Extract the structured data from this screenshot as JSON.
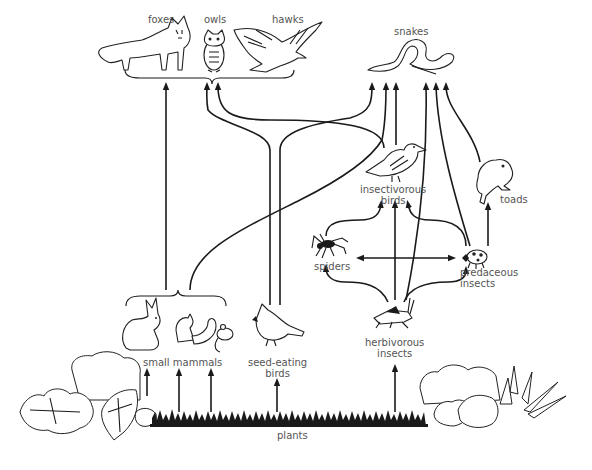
{
  "diagram": {
    "type": "food-web",
    "nodes": {
      "foxes": {
        "label": "foxes",
        "icon": "fox-icon"
      },
      "owls": {
        "label": "owls",
        "icon": "owl-icon"
      },
      "hawks": {
        "label": "hawks",
        "icon": "hawk-icon"
      },
      "snakes": {
        "label": "snakes",
        "icon": "snake-icon"
      },
      "insectivorous_birds": {
        "label_line1": "insectivorous",
        "label_line2": "birds",
        "icon": "songbird-icon"
      },
      "toads": {
        "label": "toads",
        "icon": "toad-icon"
      },
      "spiders": {
        "label": "spiders",
        "icon": "spider-icon"
      },
      "predaceous_insects": {
        "label_line1": "predaceous",
        "label_line2": "insects",
        "icon": "ladybug-icon"
      },
      "small_mammals": {
        "label": "small mammals",
        "icon": "rabbit-squirrel-mouse-icon"
      },
      "seed_eating_birds": {
        "label_line1": "seed-eating",
        "label_line2": "birds",
        "icon": "cardinal-icon"
      },
      "herbivorous_insects": {
        "label_line1": "herbivorous",
        "label_line2": "insects",
        "icon": "grasshopper-icon"
      },
      "plants": {
        "label": "plants",
        "icon": "plants-grass-icon"
      }
    },
    "edges": [
      {
        "from": "plants",
        "to": "small mammals"
      },
      {
        "from": "plants",
        "to": "seed-eating birds"
      },
      {
        "from": "plants",
        "to": "herbivorous insects"
      },
      {
        "from": "small mammals",
        "to": "foxes/owls/hawks"
      },
      {
        "from": "small mammals",
        "to": "snakes"
      },
      {
        "from": "seed-eating birds",
        "to": "foxes/owls/hawks"
      },
      {
        "from": "seed-eating birds",
        "to": "snakes"
      },
      {
        "from": "insectivorous birds",
        "to": "foxes/owls/hawks"
      },
      {
        "from": "insectivorous birds",
        "to": "snakes"
      },
      {
        "from": "spiders",
        "to": "insectivorous birds"
      },
      {
        "from": "herbivorous insects",
        "to": "insectivorous birds"
      },
      {
        "from": "predaceous insects",
        "to": "insectivorous birds"
      },
      {
        "from": "spiders",
        "to": "predaceous insects"
      },
      {
        "from": "predaceous insects",
        "to": "spiders"
      },
      {
        "from": "herbivorous insects",
        "to": "spiders"
      },
      {
        "from": "herbivorous insects",
        "to": "predaceous insects"
      },
      {
        "from": "herbivorous insects",
        "to": "snakes"
      },
      {
        "from": "predaceous insects",
        "to": "snakes"
      },
      {
        "from": "predaceous insects",
        "to": "toads"
      },
      {
        "from": "toads",
        "to": "snakes"
      }
    ],
    "colors": {
      "line": "#1a1a1a",
      "label": "#555555",
      "background": "#ffffff"
    }
  }
}
